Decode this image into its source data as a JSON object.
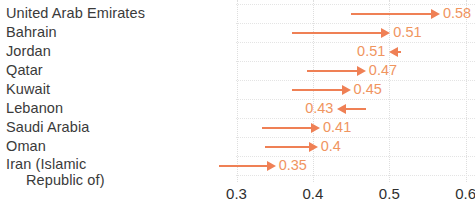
{
  "chart_data": {
    "type": "bar",
    "title": "",
    "subtitle": "",
    "xlabel": "",
    "ylabel": "",
    "xlim": [
      0.28,
      0.62
    ],
    "grid": true,
    "legend": null,
    "orientation": "horizontal",
    "categories": [
      "United Arab Emirates",
      "Bahrain",
      "Jordan",
      "Qatar",
      "Kuwait",
      "Lebanon",
      "Saudi Arabia",
      "Oman",
      "Iran (Islamic Republic of)"
    ],
    "values": [
      0.58,
      0.51,
      0.51,
      0.47,
      0.45,
      0.43,
      0.41,
      0.4,
      0.35
    ],
    "value_labels": [
      "0.58",
      "0.51",
      "0.51",
      "0.47",
      "0.45",
      "0.43",
      "0.41",
      "0.4",
      "0.35"
    ],
    "xticks": [
      0.3,
      0.4,
      0.5,
      0.6
    ],
    "xtick_labels": [
      "0.3",
      "0.4",
      "0.5",
      "0.6"
    ],
    "colors": {
      "arrow": "#ef8055",
      "value_label": "#f0955f",
      "category_label": "#3a3a3a",
      "tick_label": "#2f2f2f",
      "gridline": "#dedede",
      "background": "#ffffff"
    },
    "rows": [
      {
        "category": "United Arab Emirates",
        "category_line1": "United Arab Emirates",
        "category_line2": "",
        "value": 0.58,
        "value_label": "0.58",
        "arrow_direction": "right",
        "arrow_start": 0.45,
        "arrow_end": 0.565
      },
      {
        "category": "Bahrain",
        "category_line1": "Bahrain",
        "category_line2": "",
        "value": 0.51,
        "value_label": "0.51",
        "arrow_direction": "right",
        "arrow_start": 0.373,
        "arrow_end": 0.5
      },
      {
        "category": "Jordan",
        "category_line1": "Jordan",
        "category_line2": "",
        "value": 0.51,
        "value_label": "0.51",
        "arrow_direction": "left",
        "arrow_start": 0.515,
        "arrow_end": 0.5
      },
      {
        "category": "Qatar",
        "category_line1": "Qatar",
        "category_line2": "",
        "value": 0.47,
        "value_label": "0.47",
        "arrow_direction": "right",
        "arrow_start": 0.392,
        "arrow_end": 0.468
      },
      {
        "category": "Kuwait",
        "category_line1": "Kuwait",
        "category_line2": "",
        "value": 0.45,
        "value_label": "0.45",
        "arrow_direction": "right",
        "arrow_start": 0.373,
        "arrow_end": 0.448
      },
      {
        "category": "Lebanon",
        "category_line1": "Lebanon",
        "category_line2": "",
        "value": 0.43,
        "value_label": "0.43",
        "arrow_direction": "left",
        "arrow_start": 0.47,
        "arrow_end": 0.432
      },
      {
        "category": "Saudi Arabia",
        "category_line1": "Saudi Arabia",
        "category_line2": "",
        "value": 0.41,
        "value_label": "0.41",
        "arrow_direction": "right",
        "arrow_start": 0.333,
        "arrow_end": 0.408
      },
      {
        "category": "Oman",
        "category_line1": "Oman",
        "category_line2": "",
        "value": 0.4,
        "value_label": "0.4",
        "arrow_direction": "right",
        "arrow_start": 0.337,
        "arrow_end": 0.405
      },
      {
        "category": "Iran (Islamic Republic of)",
        "category_line1": "Iran (Islamic",
        "category_line2": "Republic of)",
        "value": 0.35,
        "value_label": "0.35",
        "arrow_direction": "right",
        "arrow_start": 0.277,
        "arrow_end": 0.35
      }
    ]
  }
}
